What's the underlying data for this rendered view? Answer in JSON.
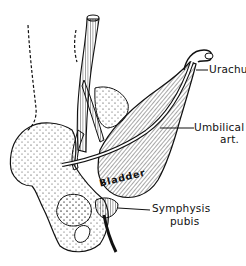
{
  "figure": {
    "labels": {
      "urachus": "Urachus",
      "umbilical_artery_line1": "Umbilical",
      "umbilical_artery_line2": "art.",
      "bladder": "Bladder",
      "symphysis_line1": "Symphysis",
      "symphysis_line2": "pubis"
    },
    "colors": {
      "ink": "#111111",
      "background": "#ffffff"
    }
  }
}
